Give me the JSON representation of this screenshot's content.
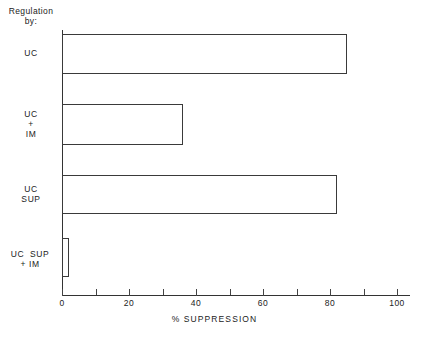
{
  "chart_data": {
    "type": "bar",
    "orientation": "horizontal",
    "title": "",
    "xlabel": "% SUPPRESSION",
    "ylabel": "Regulation\nby:",
    "categories": [
      "UC",
      "UC\n+\nIM",
      "UC\nSUP",
      "UC  SUP\n+ IM"
    ],
    "values": [
      85,
      36,
      82,
      2
    ],
    "xlim": [
      0,
      105
    ],
    "xticks": [
      0,
      10,
      20,
      30,
      40,
      50,
      60,
      70,
      80,
      90,
      100
    ],
    "xticklabels": [
      "0",
      "",
      "20",
      "",
      "40",
      "",
      "60",
      "",
      "80",
      "",
      "100"
    ],
    "grid": false,
    "legend": null,
    "bar_style": {
      "fill": "#ffffff",
      "edge": "#3a3a3a"
    }
  },
  "axis": {
    "header": "Regulation\nby:",
    "x_title": "% SUPPRESSION",
    "labels": {
      "uc": "UC",
      "uc_im": "UC\n+\nIM",
      "uc_sup": "UC\nSUP",
      "uc_sup_im": "UC  SUP\n+ IM"
    },
    "tick_labels": {
      "t0": "0",
      "t20": "20",
      "t40": "40",
      "t60": "60",
      "t80": "80",
      "t100": "100"
    }
  },
  "colors": {
    "axis": "#333333",
    "bar_edge": "#3a3a3a",
    "bar_fill": "#ffffff",
    "background": "#ffffff",
    "text": "#222222"
  }
}
